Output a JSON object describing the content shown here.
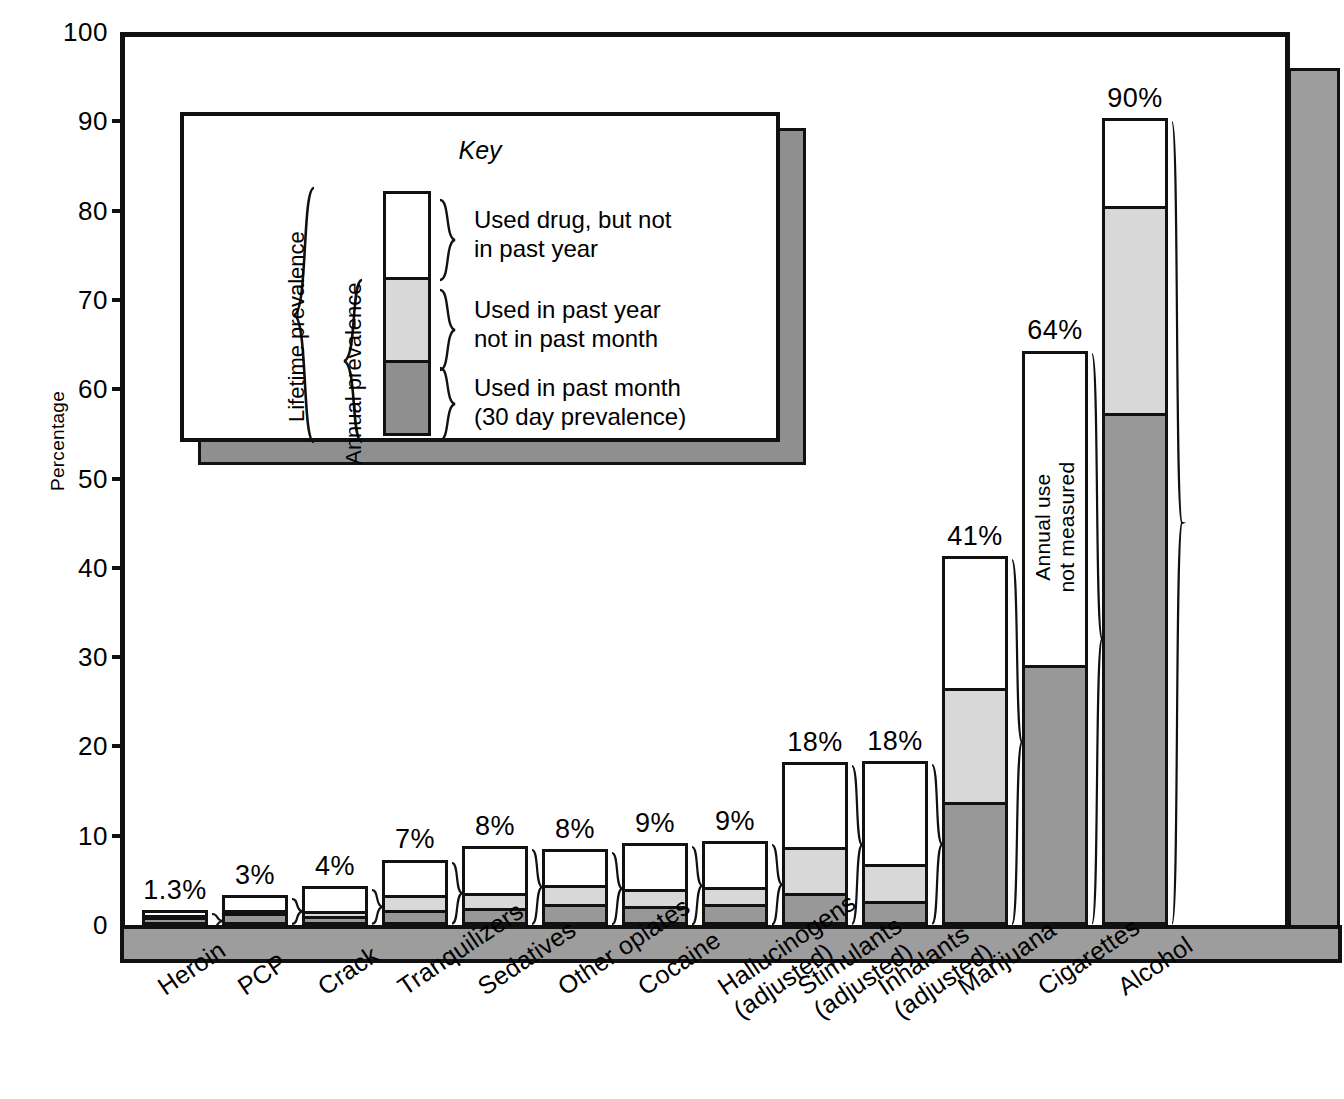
{
  "chart_data": {
    "type": "bar",
    "subtype": "stacked-bar",
    "title": "",
    "xlabel": "",
    "ylabel": "Percentage",
    "ylim": [
      0,
      100
    ],
    "yticks": [
      0,
      10,
      20,
      30,
      40,
      50,
      60,
      70,
      80,
      90,
      100
    ],
    "grid": false,
    "legend_position": "inside-upper-left",
    "categories": [
      "Heroin",
      "PCP",
      "Crack",
      "Tranquilizers",
      "Sedatives",
      "Other opiates",
      "Cocaine",
      "Hallucinogens\n(adjusted)",
      "Stimulants\n(adjusted)",
      "Inhalants\n(adjusted)",
      "Marijuana",
      "Cigarettes",
      "Alcohol"
    ],
    "category_lines": [
      [
        "Heroin"
      ],
      [
        "PCP"
      ],
      [
        "Crack"
      ],
      [
        "Tranquilizers"
      ],
      [
        "Sedatives"
      ],
      [
        "Other opiates"
      ],
      [
        "Cocaine"
      ],
      [
        "Hallucinogens",
        "(adjusted)"
      ],
      [
        "Stimulants",
        "(adjusted)"
      ],
      [
        "Inhalants",
        "(adjusted)"
      ],
      [
        "Marijuana"
      ],
      [
        "Cigarettes"
      ],
      [
        "Alcohol"
      ]
    ],
    "series": [
      {
        "name": "Used in past month (30 day prevalence)",
        "key": "past_month",
        "color": "#989898",
        "values": [
          0.6,
          1.0,
          0.7,
          1.4,
          1.6,
          2.0,
          1.8,
          2.0,
          3.3,
          2.4,
          13.4,
          28.8,
          57.0
        ]
      },
      {
        "name": "Used in past year not in past month",
        "key": "past_year_not_month",
        "color": "#d8d8d8",
        "values": [
          0.2,
          0.4,
          0.5,
          1.6,
          1.7,
          2.1,
          1.9,
          1.9,
          5.1,
          4.1,
          12.8,
          0,
          23.2
        ]
      },
      {
        "name": "Used drug, but not in past year",
        "key": "lifetime_not_year",
        "color": "#ffffff",
        "values": [
          0.5,
          1.6,
          2.8,
          4.0,
          5.2,
          4.1,
          5.2,
          5.2,
          9.5,
          11.5,
          14.8,
          35.2,
          9.8
        ]
      }
    ],
    "totals_labels": [
      "1.3%",
      "3%",
      "4%",
      "7%",
      "8%",
      "8%",
      "9%",
      "9%",
      "18%",
      "18%",
      "41%",
      "64%",
      "90%"
    ],
    "totals": [
      1.3,
      3.0,
      4.0,
      7.0,
      8.5,
      8.2,
      8.9,
      9.1,
      17.9,
      18.0,
      41.0,
      64.0,
      90.0
    ],
    "annotations": [
      {
        "text": "Annual use not measured",
        "lines": [
          "Annual use",
          "not measured"
        ],
        "for_category": "Cigarettes"
      }
    ]
  },
  "axis": {
    "y_title": "Percentage",
    "y_ticks": [
      "100",
      "90",
      "80",
      "70",
      "60",
      "50",
      "40",
      "30",
      "20",
      "10",
      "0"
    ]
  },
  "key": {
    "title": "Key",
    "lifetime_bracket_label_lines": [
      "Lifetime",
      "prevalence"
    ],
    "annual_bracket_label_lines": [
      "Annual",
      "prevalence"
    ],
    "entries": [
      {
        "swatch": "white",
        "lines": [
          "Used drug, but not",
          "in past year"
        ]
      },
      {
        "swatch": "light",
        "lines": [
          "Used in past year",
          "not in past month"
        ]
      },
      {
        "swatch": "dark",
        "lines": [
          "Used in past month",
          "(30 day prevalence)"
        ]
      }
    ]
  },
  "colors": {
    "past_month": "#989898",
    "past_year_not_month": "#d8d8d8",
    "lifetime_not_year": "#ffffff",
    "outline": "#111111",
    "shadow": "#9d9d9d"
  }
}
